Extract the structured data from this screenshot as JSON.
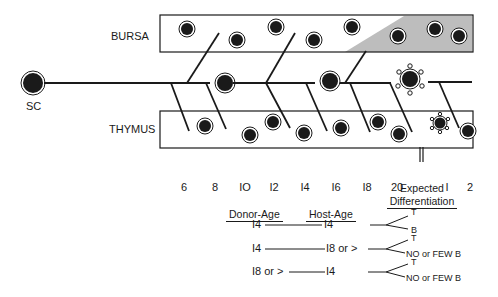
{
  "labels": {
    "bursa": "BURSA",
    "thymus": "THYMUS",
    "stem_cell": "SC"
  },
  "axis": {
    "ticks_embryonic": [
      "6",
      "8",
      "IO",
      "I2",
      "I4",
      "I6",
      "I8",
      "20"
    ],
    "ticks_posthatch": [
      "I",
      "2"
    ],
    "break_marker": "||"
  },
  "table": {
    "headers": {
      "donor_age": "Donor-Age",
      "host_age": "Host-Age",
      "expected_top": "Expected",
      "expected_bottom": "Differentiation"
    },
    "rows": [
      {
        "donor": "I4",
        "host": "I4",
        "upper": "T",
        "lower": "B"
      },
      {
        "donor": "I4",
        "host": "I8 or >",
        "upper": "T",
        "lower": "NO or FEW B"
      },
      {
        "donor": "I8 or >",
        "host": "I4",
        "upper": "T",
        "lower": "NO or FEW B"
      }
    ]
  },
  "colors": {
    "ink": "#1a1a1a",
    "shade": "#b8b8b8",
    "background": "#ffffff"
  }
}
